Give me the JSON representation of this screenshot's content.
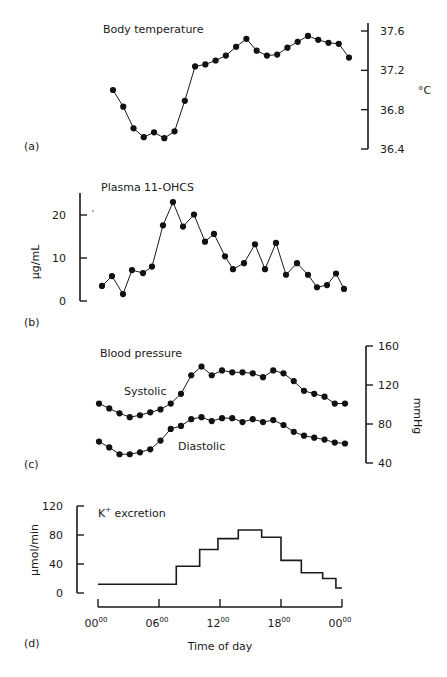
{
  "chart_data": [
    {
      "id": "a",
      "panel_label": "(a)",
      "type": "line",
      "title": "Body temperature",
      "ylabel": "°C",
      "yaxis_side": "right",
      "ylim": [
        36.4,
        37.6
      ],
      "yticks": [
        36.4,
        36.8,
        37.2,
        37.6
      ],
      "ytick_labels": [
        "36.4",
        "36.8",
        "37.2",
        "37.6"
      ],
      "x_hours": [
        2,
        3,
        4,
        5,
        6,
        7,
        8,
        9,
        10,
        11,
        12,
        13,
        14,
        15,
        16,
        17,
        18,
        19,
        20,
        21,
        22,
        23,
        24,
        25
      ],
      "values": [
        37.0,
        36.83,
        36.61,
        36.52,
        36.57,
        36.51,
        36.58,
        36.89,
        37.24,
        37.26,
        37.3,
        37.35,
        37.44,
        37.52,
        37.4,
        37.35,
        37.36,
        37.43,
        37.49,
        37.55,
        37.51,
        37.48,
        37.47,
        37.33
      ]
    },
    {
      "id": "b",
      "panel_label": "(b)",
      "type": "line",
      "title": "Plasma 11-OHCS",
      "ylabel": "µg/mL",
      "yaxis_side": "left",
      "ylim": [
        0,
        25
      ],
      "yticks": [
        0,
        10,
        20
      ],
      "ytick_labels": [
        "0",
        "10",
        "20"
      ],
      "values": [
        3.5,
        5.8,
        1.6,
        7.2,
        6.5,
        8.0,
        17.6,
        23.0,
        17.3,
        20.1,
        13.8,
        15.6,
        10.4,
        7.4,
        8.8,
        13.2,
        7.4,
        13.5,
        6.1,
        8.8,
        6.1,
        3.2,
        3.7,
        6.4,
        2.8
      ],
      "x_positions_px": [
        102,
        112,
        123,
        132,
        143,
        152,
        163,
        173,
        183,
        194,
        205,
        214,
        225,
        233,
        244,
        255,
        265,
        276,
        286,
        297,
        308,
        317,
        327,
        336,
        344
      ]
    },
    {
      "id": "c",
      "panel_label": "(c)",
      "type": "line",
      "title": "Blood pressure",
      "ylabel": "mmHg",
      "yaxis_side": "right",
      "ylim": [
        40,
        160
      ],
      "yticks": [
        40,
        80,
        120,
        160
      ],
      "ytick_labels": [
        "40",
        "80",
        "120",
        "160"
      ],
      "series": [
        {
          "name": "Systolic",
          "values": [
            101,
            96,
            91,
            87,
            89,
            92,
            95,
            101,
            111,
            130,
            139,
            130,
            135,
            133,
            133,
            132,
            128,
            135,
            132,
            124,
            114,
            111,
            108,
            101,
            101
          ]
        },
        {
          "name": "Diastolic",
          "values": [
            62,
            56,
            49,
            49,
            51,
            54,
            63,
            75,
            78,
            85,
            87,
            83,
            86,
            86,
            82,
            85,
            82,
            84,
            79,
            72,
            68,
            66,
            64,
            61,
            60
          ]
        }
      ]
    },
    {
      "id": "d",
      "panel_label": "(d)",
      "type": "step",
      "title": "K+ excretion",
      "title_main": "K",
      "title_sup": "+",
      "title_rest": " excretion",
      "ylabel": "µmol/min",
      "yaxis_side": "left",
      "ylim": [
        0,
        120
      ],
      "yticks": [
        0,
        40,
        80,
        120
      ],
      "ytick_labels": [
        "0",
        "40",
        "80",
        "120"
      ],
      "xlabel": "Time of day",
      "xlim": [
        0,
        24
      ],
      "xticks": [
        0,
        6,
        12,
        18,
        24
      ],
      "xtick_labels": [
        {
          "main": "00",
          "sup": "00"
        },
        {
          "main": "06",
          "sup": "00"
        },
        {
          "main": "12",
          "sup": "00"
        },
        {
          "main": "18",
          "sup": "00"
        },
        {
          "main": "00",
          "sup": "00"
        }
      ],
      "steps": [
        {
          "from": 0,
          "to": 7.7,
          "value": 12
        },
        {
          "from": 7.7,
          "to": 10.0,
          "value": 37
        },
        {
          "from": 10.0,
          "to": 11.8,
          "value": 60
        },
        {
          "from": 11.8,
          "to": 13.8,
          "value": 75
        },
        {
          "from": 13.8,
          "to": 16.1,
          "value": 87
        },
        {
          "from": 16.1,
          "to": 18.0,
          "value": 77
        },
        {
          "from": 18.0,
          "to": 20.0,
          "value": 45
        },
        {
          "from": 20.0,
          "to": 22.1,
          "value": 28
        },
        {
          "from": 22.1,
          "to": 23.4,
          "value": 20
        },
        {
          "from": 23.4,
          "to": 24.0,
          "value": 7
        }
      ]
    }
  ],
  "labels": {
    "a_title": "Body temperature",
    "a_panel": "(a)",
    "a_unit": "°C",
    "b_title": "Plasma 11-OHCS",
    "b_panel": "(b)",
    "b_unit": "µg/mL",
    "c_title": "Blood pressure",
    "c_panel": "(c)",
    "c_unit": "mmHg",
    "c_systolic": "Systolic",
    "c_diastolic": "Diastolic",
    "d_panel": "(d)",
    "d_unit": "µmol/min",
    "d_xlabel": "Time of day",
    "d_title_main": "K",
    "d_title_sup": "+",
    "d_title_rest": " excretion"
  }
}
